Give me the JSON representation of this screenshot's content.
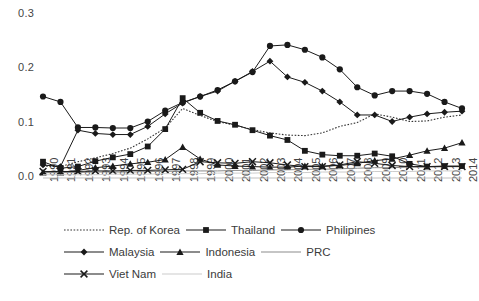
{
  "chart_data": {
    "type": "line",
    "title": "",
    "xlabel": "",
    "ylabel": "",
    "ylim": [
      0.0,
      0.3
    ],
    "yticks": [
      0.0,
      0.1,
      0.2,
      0.3
    ],
    "ytick_labels": [
      "0.0",
      "0.1",
      "0.2",
      "0.3"
    ],
    "grid": false,
    "legend_position": "bottom",
    "x": [
      1990,
      1991,
      1992,
      1993,
      1994,
      1995,
      1996,
      1997,
      1998,
      1999,
      2000,
      2001,
      2002,
      2003,
      2004,
      2005,
      2006,
      2007,
      2008,
      2009,
      2010,
      2011,
      2012,
      2013,
      2014
    ],
    "xtick_labels": [
      "1990",
      "1991",
      "1992",
      "1993",
      "1994",
      "1995",
      "1996",
      "1997",
      "1998",
      "1999",
      "2000",
      "2001",
      "2002",
      "2003",
      "2004",
      "2005",
      "2006",
      "2007",
      "2008",
      "2009",
      "2010",
      "2011",
      "2012",
      "2013",
      "2014"
    ],
    "series": [
      {
        "name": "Rep. of Korea",
        "marker": "none",
        "line": "dotted",
        "color": "#333333",
        "values": [
          0.022,
          0.021,
          0.03,
          0.037,
          0.045,
          0.055,
          0.072,
          0.092,
          0.128,
          0.115,
          0.104,
          0.097,
          0.089,
          0.083,
          0.079,
          0.078,
          0.083,
          0.095,
          0.102,
          0.118,
          0.112,
          0.104,
          0.105,
          0.112,
          0.116
        ]
      },
      {
        "name": "Thailand",
        "marker": "square",
        "line": "solid",
        "color": "#1a1a1a",
        "values": [
          0.03,
          0.018,
          0.021,
          0.031,
          0.038,
          0.044,
          0.058,
          0.09,
          0.147,
          0.12,
          0.105,
          0.098,
          0.088,
          0.078,
          0.07,
          0.05,
          0.043,
          0.041,
          0.041,
          0.045,
          0.04,
          0.026,
          0.021,
          0.022,
          0.022
        ]
      },
      {
        "name": "Philipines",
        "marker": "circle",
        "line": "solid",
        "color": "#1a1a1a",
        "values": [
          0.15,
          0.14,
          0.093,
          0.093,
          0.092,
          0.092,
          0.104,
          0.124,
          0.139,
          0.15,
          0.162,
          0.178,
          0.195,
          0.243,
          0.245,
          0.236,
          0.222,
          0.2,
          0.167,
          0.152,
          0.16,
          0.16,
          0.155,
          0.14,
          0.128
        ]
      },
      {
        "name": "Malaysia",
        "marker": "diamond",
        "line": "solid",
        "color": "#1a1a1a",
        "values": [
          0.024,
          0.021,
          0.088,
          0.082,
          0.08,
          0.08,
          0.095,
          0.118,
          0.138,
          0.15,
          0.16,
          0.178,
          0.196,
          0.215,
          0.186,
          0.176,
          0.16,
          0.14,
          0.116,
          0.116,
          0.104,
          0.112,
          0.118,
          0.121,
          0.123
        ]
      },
      {
        "name": "Indonesia",
        "marker": "triangle",
        "line": "solid",
        "color": "#1a1a1a",
        "values": [
          0.01,
          0.01,
          0.014,
          0.019,
          0.022,
          0.026,
          0.029,
          0.034,
          0.057,
          0.035,
          0.024,
          0.022,
          0.021,
          0.02,
          0.02,
          0.022,
          0.022,
          0.023,
          0.027,
          0.032,
          0.035,
          0.042,
          0.05,
          0.055,
          0.065
        ]
      },
      {
        "name": "PRC",
        "marker": "none",
        "line": "solid",
        "color": "#8c8c8c",
        "values": [
          0.01,
          0.01,
          0.01,
          0.011,
          0.011,
          0.011,
          0.012,
          0.012,
          0.013,
          0.013,
          0.013,
          0.014,
          0.014,
          0.015,
          0.015,
          0.016,
          0.016,
          0.017,
          0.018,
          0.019,
          0.019,
          0.02,
          0.02,
          0.021,
          0.021
        ]
      },
      {
        "name": "Viet Nam",
        "marker": "cross",
        "line": "solid",
        "color": "#1a1a1a",
        "values": [
          0.012,
          0.012,
          0.012,
          0.013,
          0.013,
          0.014,
          0.014,
          0.015,
          0.016,
          0.03,
          0.028,
          0.027,
          0.03,
          0.028,
          0.024,
          0.021,
          0.021,
          0.024,
          0.03,
          0.027,
          0.023,
          0.021,
          0.021,
          0.021,
          0.021
        ]
      },
      {
        "name": "India",
        "marker": "none",
        "line": "solid",
        "color": "#cccccc",
        "values": [
          0.006,
          0.006,
          0.006,
          0.006,
          0.007,
          0.007,
          0.007,
          0.008,
          0.008,
          0.008,
          0.009,
          0.009,
          0.009,
          0.01,
          0.01,
          0.01,
          0.011,
          0.011,
          0.011,
          0.012,
          0.012,
          0.012,
          0.013,
          0.013,
          0.013
        ]
      }
    ]
  },
  "legend": {
    "rows": [
      [
        {
          "label": "Rep. of Korea",
          "marker": "none",
          "line": "dotted",
          "color": "#333333"
        },
        {
          "label": "Thailand",
          "marker": "square",
          "line": "solid",
          "color": "#1a1a1a"
        },
        {
          "label": "Philipines",
          "marker": "circle",
          "line": "solid",
          "color": "#1a1a1a"
        }
      ],
      [
        {
          "label": "Malaysia",
          "marker": "diamond",
          "line": "solid",
          "color": "#1a1a1a"
        },
        {
          "label": "Indonesia",
          "marker": "triangle",
          "line": "solid",
          "color": "#1a1a1a"
        },
        {
          "label": "PRC",
          "marker": "none",
          "line": "solid",
          "color": "#8c8c8c"
        }
      ],
      [
        {
          "label": "Viet Nam",
          "marker": "cross",
          "line": "solid",
          "color": "#1a1a1a"
        },
        {
          "label": "India",
          "marker": "none",
          "line": "solid",
          "color": "#cccccc"
        }
      ]
    ]
  },
  "caption": ""
}
